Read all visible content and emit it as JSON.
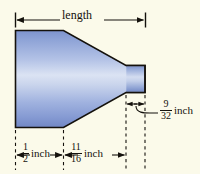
{
  "figure": {
    "kind": "engineering-dimension-diagram",
    "background_color": "#fbfaea",
    "outline_color": "#14110c",
    "body_fill_light": "#dde4f4",
    "body_fill_mid": "#97aede",
    "body_fill_dark": "#6f86c4"
  },
  "dimensions": {
    "length": {
      "label": "length",
      "type": "overall-span"
    },
    "half_inch": {
      "numerator": "1",
      "denominator": "2",
      "unit": "inch"
    },
    "eleven_sixteenths": {
      "numerator": "11",
      "denominator": "16",
      "unit": "inch"
    },
    "nine_thirtyseconds": {
      "numerator": "9",
      "denominator": "32",
      "unit": "inch"
    }
  }
}
